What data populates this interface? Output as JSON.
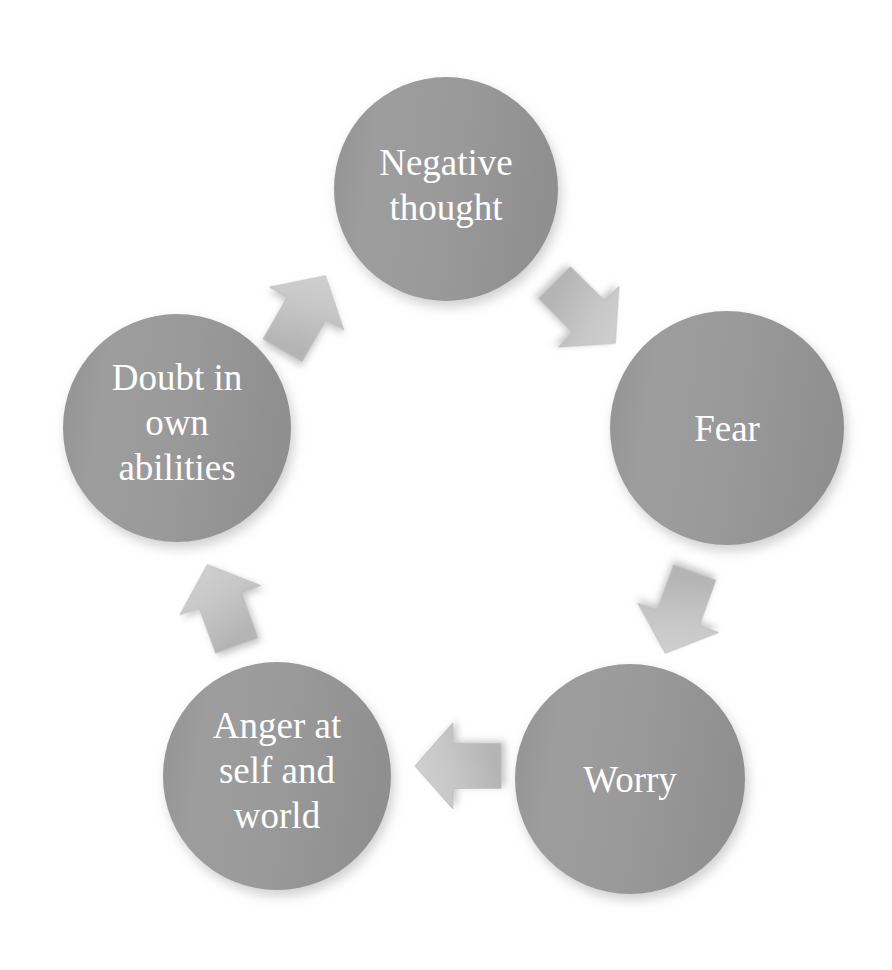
{
  "diagram": {
    "type": "cycle",
    "background_color": "#ffffff",
    "node_fill_color": "#9a9a9a",
    "node_fill_color_dark": "#8d8d8d",
    "node_text_color": "#ffffff",
    "arrow_fill_color": "#c9c9c9",
    "arrow_fill_color_dark": "#b6b6b6",
    "shadow_color": "#bdbdbd",
    "nodes": [
      {
        "id": "negative-thought",
        "label": "Negative thought",
        "lines": [
          "Negative",
          "thought"
        ],
        "cx": 446,
        "cy": 189,
        "r": 112,
        "font_size": 37,
        "line_height": 45,
        "text_offset_y": -4
      },
      {
        "id": "fear",
        "label": "Fear",
        "lines": [
          "Fear"
        ],
        "cx": 727,
        "cy": 428,
        "r": 117,
        "font_size": 37,
        "line_height": 45,
        "text_offset_y": 0
      },
      {
        "id": "worry",
        "label": "Worry",
        "lines": [
          "Worry"
        ],
        "cx": 630,
        "cy": 779,
        "r": 115,
        "font_size": 37,
        "line_height": 45,
        "text_offset_y": 0
      },
      {
        "id": "anger-at-self-and-world",
        "label": "Anger at self and world",
        "lines": [
          "Anger at",
          "self and",
          "world"
        ],
        "cx": 277,
        "cy": 776,
        "r": 114,
        "font_size": 37,
        "line_height": 45,
        "text_offset_y": -6
      },
      {
        "id": "doubt-in-own-abilities",
        "label": "Doubt in own abilities",
        "lines": [
          "Doubt in",
          "own",
          "abilities"
        ],
        "cx": 177,
        "cy": 428,
        "r": 114,
        "font_size": 37,
        "line_height": 45,
        "text_offset_y": -6
      }
    ],
    "arrows": [
      {
        "id": "negative-thought-to-fear",
        "from": "negative-thought",
        "to": "fear",
        "direction": "southeast",
        "rotation_deg": 135,
        "cx": 585,
        "cy": 313,
        "size": 86
      },
      {
        "id": "fear-to-worry",
        "from": "fear",
        "to": "worry",
        "direction": "southwest",
        "rotation_deg": 200,
        "cx": 680,
        "cy": 613,
        "size": 86
      },
      {
        "id": "worry-to-anger",
        "from": "worry",
        "to": "anger-at-self-and-world",
        "direction": "west",
        "rotation_deg": 270,
        "cx": 458,
        "cy": 766,
        "size": 86
      },
      {
        "id": "anger-to-doubt",
        "from": "anger-at-self-and-world",
        "to": "doubt-in-own-abilities",
        "direction": "northwest",
        "rotation_deg": 340,
        "cx": 222,
        "cy": 605,
        "size": 86
      },
      {
        "id": "doubt-to-negative-thought",
        "from": "doubt-in-own-abilities",
        "to": "negative-thought",
        "direction": "northeast",
        "rotation_deg": 30,
        "cx": 304,
        "cy": 313,
        "size": 86
      }
    ]
  }
}
